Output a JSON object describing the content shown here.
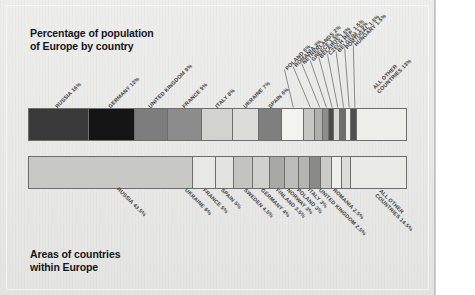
{
  "poster": {
    "background_color": "#e9e9e7",
    "frame_color": "#6d6d6d"
  },
  "top": {
    "title": "Percentage of population\nof Europe by country",
    "all_other_label": "ALL OTHER\nCOUNTRIES 13%"
  },
  "bottom": {
    "title": "Areas of countries\nwithin Europe"
  },
  "chart_data": [
    {
      "type": "bar",
      "orientation": "stacked-horizontal",
      "title": "Percentage of population of Europe by country",
      "xlabel": "",
      "ylabel": "",
      "unit": "percent",
      "total": 100,
      "categories": [
        "RUSSIA",
        "GERMANY",
        "UNITED KINGDOM",
        "FRANCE",
        "ITALY",
        "UKRAINE",
        "SPAIN",
        "POLAND",
        "ROMANIA",
        "NETHERLANDS",
        "GREECE",
        "BELARUS",
        "CZECH REP.",
        "BELGIUM",
        "PORTUGAL",
        "HUNGARY",
        "ALL OTHER COUNTRIES"
      ],
      "values": [
        16,
        12,
        9,
        9,
        8,
        7,
        6,
        6,
        3,
        2,
        1.5,
        1.5,
        1.5,
        1.5,
        1.5,
        1.5,
        13
      ],
      "labels": [
        "RUSSIA 16%",
        "GERMANY 12%",
        "UNITED KINGDOM 9%",
        "FRANCE 9%",
        "ITALY 8%",
        "UKRAINE 7%",
        "SPAIN 6%",
        "POLAND 6%",
        "ROMANIA 3%",
        "NETHERLANDS 2%",
        "GREECE 1.5%",
        "BELARUS 1.5%",
        "CZECH REP. 1.5%",
        "BELGIUM 1.5%",
        "PORTUGAL 1.5%",
        "HUNGARY 1.5%",
        "ALL OTHER COUNTRIES 13%"
      ],
      "colors": [
        "#3a3a3a",
        "#151515",
        "#7d7d7d",
        "#8c8c8c",
        "#d2d2cf",
        "#dcdcd8",
        "#7f7f7f",
        "#f3f3f0",
        "#c6c6c2",
        "#b0b0ac",
        "#8e8e8a",
        "#4a4a48",
        "#d7d7d3",
        "#6e6e6c",
        "#efefec",
        "#4f4f4d",
        "#eeeeeb"
      ]
    },
    {
      "type": "bar",
      "orientation": "stacked-horizontal",
      "title": "Areas of countries within Europe",
      "xlabel": "",
      "ylabel": "",
      "unit": "percent",
      "total": 100,
      "categories": [
        "RUSSIA",
        "UKRAINE",
        "FRANCE",
        "SPAIN",
        "SWEDEN",
        "GERMANY",
        "FINLAND",
        "NORWAY",
        "POLAND",
        "ITALY",
        "UNITED KINGDOM",
        "ROMANIA",
        "ALL OTHER COUNTRIES"
      ],
      "values": [
        43.5,
        6,
        5,
        5,
        4.5,
        4,
        3.5,
        3,
        3,
        3,
        2.5,
        2.5,
        14.5
      ],
      "labels": [
        "RUSSIA 43.5%",
        "UKRAINE 6%",
        "FRANCE 5%",
        "SPAIN 5%",
        "SWEDEN 4.5%",
        "GERMANY 4%",
        "FINLAND 3.5%",
        "NORWAY 3%",
        "POLAND 3%",
        "ITALY 3%",
        "UNITED KINGDOM 2.5%",
        "ROMANIA 2.5%",
        "ALL OTHER COUNTRIES 14.5%"
      ],
      "colors": [
        "#c8c8c4",
        "#e8e8e4",
        "#e3e3df",
        "#c3c3bf",
        "#d0d0cc",
        "#a8a8a4",
        "#bcbcb8",
        "#b4b4b0",
        "#8a8a86",
        "#cacac6",
        "#eeeeea",
        "#dcdcd8",
        "#eaeae7"
      ]
    }
  ]
}
